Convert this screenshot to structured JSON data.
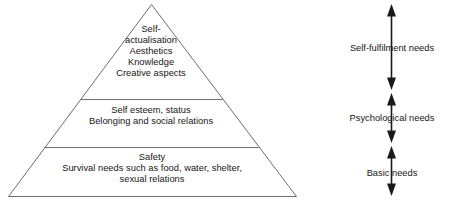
{
  "diagram": {
    "background_color": "#ffffff",
    "outline_color": "#6e6e6e",
    "text_color": "#161616",
    "arrow_color": "#1a1a1a"
  },
  "pyramid": {
    "tiers": [
      {
        "id": "self-actualisation",
        "position": "top",
        "text": "Self-\nactualisation\nAesthetics\nKnowledge\nCreative aspects",
        "lines": [
          "Self-",
          "actualisation",
          "Aesthetics",
          "Knowledge",
          "Creative aspects"
        ]
      },
      {
        "id": "esteem-belonging",
        "position": "middle",
        "text": "Self esteem, status\nBelonging and social relations",
        "lines": [
          "Self esteem, status",
          "Belonging and social relations"
        ]
      },
      {
        "id": "safety-survival",
        "position": "bottom",
        "text": "Safety\nSurvival needs such as food, water, shelter,\nsexual relations",
        "lines": [
          "Safety",
          "Survival needs such as food, water, shelter,",
          "sexual relations"
        ]
      }
    ]
  },
  "axis": {
    "labels": [
      {
        "id": "self-fulfilment",
        "text": "Self-fulfilment needs"
      },
      {
        "id": "psychological",
        "text": "Psychological needs"
      },
      {
        "id": "basic",
        "text": "Basic needs"
      }
    ],
    "arrow_style": "double-headed-vertical",
    "arrow_count": 3
  }
}
